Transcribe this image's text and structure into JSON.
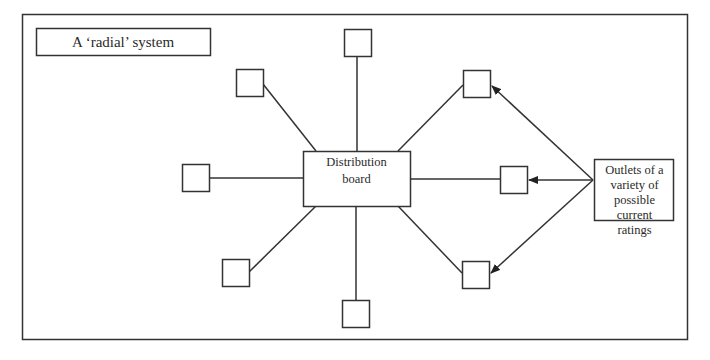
{
  "title": "A ‘radial’ system",
  "center": {
    "label_line1": "Distribution",
    "label_line2": "board"
  },
  "annotation": {
    "lines": [
      "Outlets of a",
      "variety of",
      "possible",
      "current",
      "ratings"
    ]
  },
  "outlets": [
    {
      "id": "top"
    },
    {
      "id": "upper-left"
    },
    {
      "id": "upper-right"
    },
    {
      "id": "left"
    },
    {
      "id": "right"
    },
    {
      "id": "lower-left"
    },
    {
      "id": "lower-right"
    },
    {
      "id": "bottom"
    }
  ],
  "colors": {
    "stroke": "#333333",
    "background": "#ffffff"
  }
}
